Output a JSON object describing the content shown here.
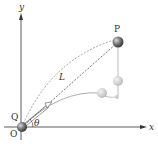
{
  "diagram": {
    "type": "projectile-motion",
    "labels": {
      "y_axis": "y",
      "x_axis": "x",
      "point_p": "P",
      "point_q": "Q",
      "origin": "O",
      "length": "L",
      "angle": "θ"
    },
    "colors": {
      "axis": "#333333",
      "ball_dark": "#555555",
      "ball_light": "#bbbbbb",
      "curve": "#999999",
      "dashed": "#555555"
    }
  }
}
